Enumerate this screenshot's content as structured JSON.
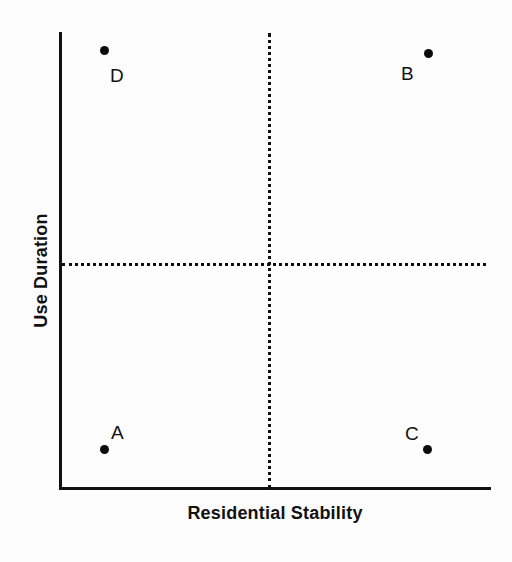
{
  "chart_data": {
    "type": "scatter",
    "title": "",
    "subtitle": "",
    "xlabel": "Residential Stability",
    "ylabel": "Use Duration",
    "xlim": [
      0,
      100
    ],
    "ylim": [
      0,
      100
    ],
    "grid": false,
    "legend": null,
    "axis_ticks": {
      "x": [],
      "y": []
    },
    "quadrant_dividers": {
      "vertical_x": 46,
      "horizontal_y": 50,
      "style": "dotted",
      "color": "#101010"
    },
    "points": [
      {
        "label": "A",
        "x": 10,
        "y": 9,
        "label_position": "upper-right",
        "color": "#0b0b0b"
      },
      {
        "label": "B",
        "x": 85,
        "y": 96,
        "label_position": "lower-left",
        "color": "#0b0b0b"
      },
      {
        "label": "C",
        "x": 85,
        "y": 9,
        "label_position": "upper-left",
        "color": "#0b0b0b"
      },
      {
        "label": "D",
        "x": 10,
        "y": 97,
        "label_position": "lower-right",
        "color": "#0b0b0b"
      }
    ],
    "quadrant_interpretation": {
      "top_left": "D",
      "top_right": "B",
      "bottom_left": "A",
      "bottom_right": "C"
    }
  },
  "axes": {
    "x_title": "Residential Stability",
    "y_title": "Use Duration",
    "line_color": "#111111"
  },
  "markers": {
    "a": {
      "label": "A"
    },
    "b": {
      "label": "B"
    },
    "c": {
      "label": "C"
    },
    "d": {
      "label": "D"
    }
  },
  "colors": {
    "ink": "#111111",
    "marker": "#0b0b0b",
    "background": "#fdfdfd"
  }
}
